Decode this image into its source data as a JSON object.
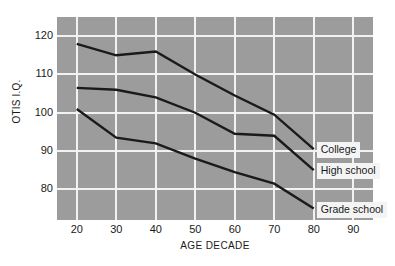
{
  "chart_data": {
    "type": "line",
    "title": "",
    "subtitle": "",
    "xlabel": "AGE DECADE",
    "ylabel": "OTIS I.Q.",
    "x": [
      20,
      30,
      40,
      50,
      60,
      70,
      80
    ],
    "xticks": [
      20,
      30,
      40,
      50,
      60,
      70,
      80,
      90
    ],
    "yticks": [
      80,
      90,
      100,
      110,
      120
    ],
    "xlim": [
      15,
      95
    ],
    "ylim": [
      72,
      125
    ],
    "grid": true,
    "legend_position": "inline-right-of-line-end",
    "series": [
      {
        "name": "College",
        "values": [
          118,
          115,
          116,
          110,
          104.5,
          99.5,
          90.5
        ]
      },
      {
        "name": "High school",
        "values": [
          106.5,
          106,
          104,
          100,
          94.5,
          94,
          85
        ]
      },
      {
        "name": "Grade school",
        "values": [
          101,
          93.5,
          92,
          88,
          84.5,
          81.5,
          75
        ]
      }
    ],
    "annotations": [
      {
        "text": "College",
        "target_series": "College"
      },
      {
        "text": "High school",
        "target_series": "High school"
      },
      {
        "text": "Grade school",
        "target_series": "Grade school"
      }
    ],
    "colors": {
      "plot_background": "#9c9c9c",
      "gridline": "#f2f2f2",
      "line": "#1a1a1a",
      "label_background": "#f4f4f4",
      "text": "#1a1a1a",
      "page_background": "#ffffff"
    }
  }
}
